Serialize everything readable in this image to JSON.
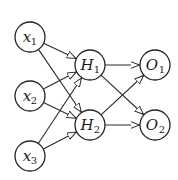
{
  "diagram": {
    "type": "neural-network",
    "layers": [
      {
        "name": "input",
        "nodes": [
          {
            "id": "x1",
            "label": "x",
            "subscript": "1",
            "cx": 30,
            "cy": 37
          },
          {
            "id": "x2",
            "label": "x",
            "subscript": "2",
            "cx": 30,
            "cy": 96
          },
          {
            "id": "x3",
            "label": "x",
            "subscript": "3",
            "cx": 30,
            "cy": 156
          }
        ]
      },
      {
        "name": "hidden",
        "nodes": [
          {
            "id": "H1",
            "label": "H",
            "subscript": "1",
            "cx": 90,
            "cy": 65
          },
          {
            "id": "H2",
            "label": "H",
            "subscript": "2",
            "cx": 90,
            "cy": 125
          }
        ]
      },
      {
        "name": "output",
        "nodes": [
          {
            "id": "O1",
            "label": "O",
            "subscript": "1",
            "cx": 155,
            "cy": 65
          },
          {
            "id": "O2",
            "label": "O",
            "subscript": "2",
            "cx": 155,
            "cy": 125
          }
        ]
      }
    ],
    "edges": [
      {
        "from": "x1",
        "to": "H1"
      },
      {
        "from": "x1",
        "to": "H2"
      },
      {
        "from": "x2",
        "to": "H1"
      },
      {
        "from": "x2",
        "to": "H2"
      },
      {
        "from": "x3",
        "to": "H1"
      },
      {
        "from": "x3",
        "to": "H2"
      },
      {
        "from": "H1",
        "to": "O1"
      },
      {
        "from": "H1",
        "to": "O2"
      },
      {
        "from": "H2",
        "to": "O1"
      },
      {
        "from": "H2",
        "to": "O2"
      }
    ],
    "node_radius": 15,
    "arrowhead": "open-triangle",
    "colors": {
      "stroke": "#222222",
      "background": "#ffffff"
    }
  }
}
